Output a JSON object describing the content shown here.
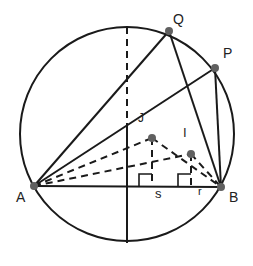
{
  "diagram": {
    "colors": {
      "stroke": "#1a1a1a",
      "point": "#606060",
      "background": "#ffffff"
    },
    "circle": {
      "cx": 127,
      "cy": 134,
      "r": 107
    },
    "points": {
      "A": {
        "x": 34,
        "y": 186,
        "label": "A"
      },
      "B": {
        "x": 221,
        "y": 187,
        "label": "B"
      },
      "Q": {
        "x": 169,
        "y": 31,
        "label": "Q"
      },
      "P": {
        "x": 215,
        "y": 68,
        "label": "P"
      },
      "J": {
        "x": 152,
        "y": 138,
        "label": "J"
      },
      "I": {
        "x": 191,
        "y": 154,
        "label": "I"
      }
    },
    "labels": {
      "A": "A",
      "B": "B",
      "Q": "Q",
      "P": "P",
      "J": "J",
      "I": "I",
      "s": "s",
      "r": "r"
    }
  }
}
